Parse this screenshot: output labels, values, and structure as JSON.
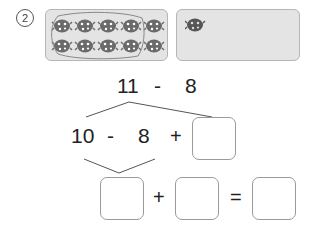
{
  "problem": {
    "number_label": "2",
    "left_panel": {
      "ladybug_count": 10,
      "rows": 2,
      "per_row": 5,
      "grouped": true
    },
    "right_panel": {
      "ladybug_count": 1
    },
    "expression": {
      "a": "11",
      "op": "-",
      "b": "8"
    },
    "step1": {
      "a": "10",
      "op1": "-",
      "b": "8",
      "op2": "+",
      "blank": ""
    },
    "step2": {
      "blank1": "",
      "op": "+",
      "blank2": "",
      "eq": "=",
      "result": ""
    }
  },
  "colors": {
    "panel_bg": "#e4e4e4",
    "panel_border": "#b5b5b5",
    "ladybug": "#666666",
    "line": "#555555"
  }
}
